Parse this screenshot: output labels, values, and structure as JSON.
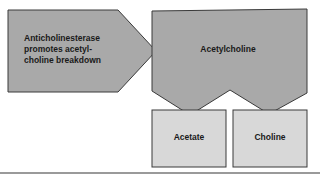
{
  "diagram": {
    "inhibitor": {
      "lines": [
        "Anticholinesterase",
        "promotes acetyl-",
        "choline breakdown"
      ]
    },
    "substrate": {
      "label": "Acetylcholine"
    },
    "products": [
      {
        "label": "Acetate"
      },
      {
        "label": "Choline"
      }
    ],
    "colors": {
      "dark_fill": "#a9a9a9",
      "light_fill": "#d8d8d8",
      "stroke": "#3a3a3a",
      "baseline": "#9a9a9a"
    }
  }
}
